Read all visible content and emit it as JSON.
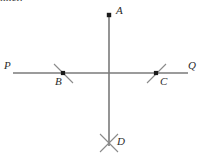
{
  "figure": {
    "title_fragment": "nner.",
    "background_color": "#ffffff",
    "line_color": "#7a7a7a",
    "tick_color": "#8a8a8a",
    "point_color": "#1a1a1a",
    "label_color": "#2b2b2b",
    "labels": {
      "a": "A",
      "b": "B",
      "c": "C",
      "d": "D",
      "p": "P",
      "q": "Q"
    },
    "points": [
      {
        "name": "A",
        "x": 109,
        "y": 15,
        "label_x": 116,
        "label_y": 8
      },
      {
        "name": "B",
        "x": 63,
        "y": 73,
        "label_x": 56,
        "label_y": 78
      },
      {
        "name": "C",
        "x": 156,
        "y": 73,
        "label_x": 160,
        "label_y": 78
      },
      {
        "name": "D",
        "x": 109,
        "y": 143,
        "label_x": 117,
        "label_y": 137
      }
    ],
    "lines": [
      {
        "name": "horizontal-line-PQ",
        "x1": 13,
        "y1": 73,
        "x2": 188,
        "y2": 73
      },
      {
        "name": "vertical-line-AD",
        "x1": 109,
        "y1": 15,
        "x2": 109,
        "y2": 145
      }
    ],
    "tick_marks": [
      {
        "name": "tick-at-B",
        "x1": 54,
        "y1": 64,
        "x2": 73,
        "y2": 83
      },
      {
        "name": "tick-at-C",
        "x1": 147,
        "y1": 83,
        "x2": 166,
        "y2": 64
      },
      {
        "name": "tick-at-D-1",
        "x1": 100,
        "y1": 134,
        "x2": 118,
        "y2": 152
      },
      {
        "name": "tick-at-D-2",
        "x1": 118,
        "y1": 134,
        "x2": 100,
        "y2": 152
      }
    ],
    "endpoint_labels": [
      {
        "name": "P",
        "x": 5,
        "y": 62
      },
      {
        "name": "Q",
        "x": 188,
        "y": 62
      }
    ]
  }
}
